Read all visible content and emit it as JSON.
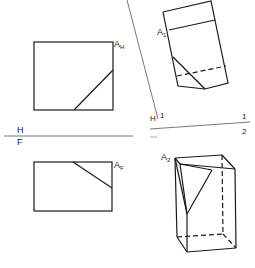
{
  "diagram": {
    "type": "descriptive-geometry auxiliary views",
    "labels": {
      "top_view": "A",
      "top_view_sub": "H",
      "front_view": "A",
      "front_view_sub": "F",
      "aux1_view": "A",
      "aux1_view_sub": "1",
      "aux2_view": "A",
      "aux2_view_sub": "2",
      "fold_hf_top": "H",
      "fold_hf_bottom": "F",
      "fold_h1_left": "H",
      "fold_h1_right": "1",
      "fold_12_top": "1",
      "fold_12_bottom": "2"
    },
    "colors": {
      "line": "#1a1a1a",
      "fold_line": "#555555",
      "background": "#ffffff"
    }
  }
}
